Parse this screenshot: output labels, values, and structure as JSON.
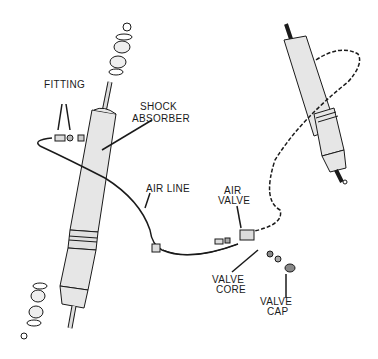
{
  "diagram": {
    "labels": {
      "fitting": "FITTING",
      "shock_absorber_1": "SHOCK",
      "shock_absorber_2": "ABSORBER",
      "air_line": "AIR LINE",
      "air_valve_1": "AIR",
      "air_valve_2": "VALVE",
      "valve_core_1": "VALVE",
      "valve_core_2": "CORE",
      "valve_cap_1": "VALVE",
      "valve_cap_2": "CAP"
    },
    "colors": {
      "line": "#1a1a1a",
      "shock_fill": "#e6e6e6",
      "background": "#ffffff"
    }
  }
}
